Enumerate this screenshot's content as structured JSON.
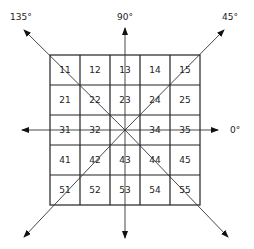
{
  "diagram": {
    "grid": {
      "rows": 5,
      "cols": 5,
      "cells": [
        [
          "11",
          "12",
          "13",
          "14",
          "15"
        ],
        [
          "21",
          "22",
          "23",
          "24",
          "25"
        ],
        [
          "31",
          "32",
          "",
          "34",
          "35"
        ],
        [
          "41",
          "42",
          "43",
          "44",
          "45"
        ],
        [
          "51",
          "52",
          "53",
          "54",
          "55"
        ]
      ],
      "center_marker": "33 (star junction)"
    },
    "directions": [
      {
        "label": "0°",
        "angle": 0
      },
      {
        "label": "45°",
        "angle": 45
      },
      {
        "label": "90°",
        "angle": 90
      },
      {
        "label": "135°",
        "angle": 135
      }
    ]
  }
}
